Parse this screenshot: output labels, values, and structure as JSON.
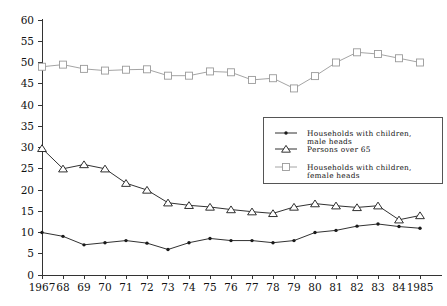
{
  "chart_data": {
    "type": "line",
    "title": "",
    "subtitle": "",
    "xlabel": "",
    "ylabel": "",
    "grid": false,
    "legend_position": "inside-right",
    "x": [
      1967,
      1968,
      1969,
      1970,
      1971,
      1972,
      1973,
      1974,
      1975,
      1976,
      1977,
      1978,
      1979,
      1980,
      1981,
      1982,
      1983,
      1984,
      1985
    ],
    "categories": [
      "1967",
      "68",
      "69",
      "70",
      "71",
      "72",
      "73",
      "74",
      "75",
      "76",
      "77",
      "78",
      "79",
      "80",
      "81",
      "82",
      "83",
      "84",
      "1985"
    ],
    "xlim": [
      1967,
      1985
    ],
    "ylim": [
      0,
      60
    ],
    "ytick_values": [
      0,
      5,
      10,
      15,
      20,
      25,
      30,
      35,
      40,
      45,
      50,
      55,
      60
    ],
    "ytick_labels": [
      "0",
      "5",
      "10",
      "15",
      "20",
      "25",
      "30",
      "35",
      "40",
      "45",
      "50",
      "55",
      "60"
    ],
    "series": [
      {
        "name": "Households with children, male heads",
        "legend_line1": "Households with children,",
        "legend_line2": "male heads",
        "marker": "dot",
        "color": "#1a1a1a",
        "values": [
          10.0,
          9.1,
          7.1,
          7.6,
          8.1,
          7.5,
          6.0,
          7.6,
          8.6,
          8.1,
          8.1,
          7.6,
          8.1,
          10.0,
          10.5,
          11.5,
          12.0,
          11.4,
          11.0
        ]
      },
      {
        "name": "Persons over 65",
        "legend_line1": "Persons over 65",
        "legend_line2": "",
        "marker": "triangle",
        "color": "#1a1a1a",
        "values": [
          29.8,
          25.0,
          26.0,
          25.0,
          21.6,
          20.0,
          17.0,
          16.4,
          16.0,
          15.4,
          14.9,
          14.5,
          16.0,
          16.8,
          16.3,
          15.9,
          16.3,
          13.0,
          14.0
        ]
      },
      {
        "name": "Households with children, female heads",
        "legend_line1": "Households with children,",
        "legend_line2": "female heads",
        "marker": "square",
        "color": "#9a9a9a",
        "values": [
          49.0,
          49.5,
          48.5,
          48.1,
          48.3,
          48.4,
          46.9,
          46.9,
          47.9,
          47.7,
          45.9,
          46.3,
          43.9,
          46.8,
          50.0,
          52.4,
          52.0,
          51.0,
          50.0
        ]
      }
    ]
  },
  "icons": {
    "dot_marker": "filled-circle-marker-icon",
    "triangle_marker": "open-triangle-marker-icon",
    "square_marker": "open-square-marker-icon"
  }
}
